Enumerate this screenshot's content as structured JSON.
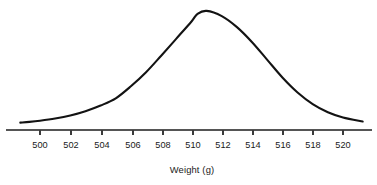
{
  "figure": {
    "name": "normal-distribution-curve",
    "background_color": "#ffffff",
    "curve_color": "#131313",
    "axis_color": "#555555",
    "text_color": "#1a1a1a"
  },
  "chart_data": {
    "type": "line",
    "title": "",
    "subtitle": "",
    "xlabel": "Weight (g)",
    "ylabel": "",
    "grid": false,
    "legend": null,
    "xlim": [
      498.7,
      521.3
    ],
    "ylim": [
      0,
      1
    ],
    "axis": {
      "tick_labels": [
        "500",
        "502",
        "504",
        "506",
        "508",
        "510",
        "512",
        "514",
        "516",
        "518",
        "520"
      ],
      "tick_values": [
        500,
        502,
        504,
        506,
        508,
        510,
        512,
        514,
        516,
        518,
        520
      ],
      "tick_step": 2,
      "tick_px": [
        40,
        71,
        102,
        133,
        163,
        193,
        223,
        253,
        283,
        313,
        343
      ],
      "axis_y_px": 130,
      "tick_length_px": 5,
      "axis_start_px": 6,
      "axis_end_px": 372
    },
    "distribution": {
      "shape": "normal",
      "mean": 510.4,
      "std_dev": 4.0,
      "peak_px": {
        "x": 193,
        "y": 8
      },
      "baseline_px": 124,
      "left_tail_px": {
        "x": 29,
        "y": 124
      },
      "right_tail_px": {
        "x": 352,
        "y": 124
      },
      "inflection_left_px": {
        "x": 132,
        "y": 66
      },
      "inflection_right_px": {
        "x": 254,
        "y": 66
      }
    },
    "x": [
      498.7,
      499.3,
      500,
      501,
      502,
      503,
      504,
      505,
      506,
      507,
      508,
      509,
      510,
      510.4,
      511,
      512,
      513,
      514,
      515,
      516,
      517,
      518,
      519,
      520,
      521.3
    ],
    "y": [
      0.012,
      0.018,
      0.028,
      0.047,
      0.073,
      0.11,
      0.159,
      0.221,
      0.325,
      0.446,
      0.589,
      0.736,
      0.884,
      0.95,
      0.975,
      0.93,
      0.835,
      0.705,
      0.553,
      0.401,
      0.272,
      0.172,
      0.102,
      0.057,
      0.022
    ]
  },
  "annotations": {
    "x_axis_title": "Weight (g)"
  }
}
